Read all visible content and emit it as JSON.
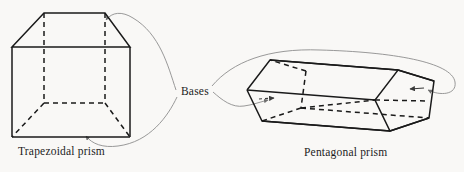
{
  "figure": {
    "title_present": false,
    "background_color": "#f9f8f6",
    "stroke_color": "#1a1a1a",
    "leader_color": "#8d8d8d",
    "width": 464,
    "height": 172
  },
  "labels": {
    "bases": "Bases",
    "trapezoidal_prism": "Trapezoidal prism",
    "pentagonal_prism": "Pentagonal prism"
  },
  "shapes": [
    {
      "name": "trapezoidal-prism",
      "caption": "Trapezoidal prism",
      "base_faces": 2,
      "base_shape": "trapezoid",
      "visible_edges": "solid",
      "hidden_edges": "dashed",
      "top_face": {
        "points": "44,13 105,13 130,47 12,47",
        "hidden": false
      },
      "bottom_face": {
        "points": "44,103 105,103 130,137 12,137",
        "hidden": true
      },
      "vertical_edges": [
        {
          "from": "12,47",
          "to": "12,137",
          "hidden": false
        },
        {
          "from": "130,47",
          "to": "130,137",
          "hidden": false
        },
        {
          "from": "44,13",
          "to": "44,103",
          "hidden": true
        },
        {
          "from": "105,13",
          "to": "105,103",
          "hidden": true
        }
      ]
    },
    {
      "name": "pentagonal-prism",
      "caption": "Pentagonal prism",
      "base_faces": 2,
      "base_shape": "pentagon",
      "visible_edges": "solid",
      "hidden_edges": "dashed",
      "front_face": {
        "points": "398,70 434,81 429,118 390,131 375,100",
        "hidden": false
      },
      "back_face": {
        "points": "270,60 306,71 301,108 262,121 247,90",
        "hidden": true
      },
      "connecting_edges": 5
    }
  ],
  "annotations": [
    {
      "name": "leader-to-trapezoid-top",
      "from": "Bases",
      "to": "trapezoidal-prism top base",
      "arrow": true
    },
    {
      "name": "leader-to-trapezoid-bottom",
      "from": "Bases",
      "to": "trapezoidal-prism bottom base",
      "arrow": true
    },
    {
      "name": "leader-to-pentagon-left",
      "from": "Bases",
      "to": "pentagonal-prism back base",
      "arrow": true
    },
    {
      "name": "leader-to-pentagon-right",
      "from": "Bases",
      "to": "pentagonal-prism front base",
      "arrow": true
    }
  ]
}
